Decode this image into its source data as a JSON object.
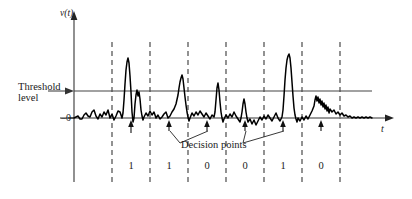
{
  "figure": {
    "type": "signal-waveform-diagram",
    "axis": {
      "y_label": "v(t)",
      "x_label": "t",
      "zero_label": "–0"
    },
    "annotations": {
      "threshold_label_line1": "Threshold",
      "threshold_label_line2": "level",
      "decision_points_label": "Decision points"
    },
    "bits": [
      {
        "value": "1",
        "x": 131
      },
      {
        "value": "1",
        "x": 169
      },
      {
        "value": "0",
        "x": 207
      },
      {
        "value": "0",
        "x": 245
      },
      {
        "value": "1",
        "x": 283
      },
      {
        "value": "0",
        "x": 321
      }
    ],
    "colors": {
      "ink": "#1a1a1a",
      "axis": "#555555",
      "dashed": "#4a4a4a",
      "background": "#ffffff"
    },
    "geometry": {
      "baseline_y": 118,
      "threshold_y": 91,
      "y_axis_x": 74,
      "t_axis_end_x": 394,
      "threshold_end_x": 372,
      "dashed_lines_x": [
        112,
        150,
        188,
        226,
        264,
        302,
        340
      ],
      "dashed_top_y": 42,
      "dashed_bottom_y": 182,
      "decision_arrows_x": [
        131,
        169,
        207,
        245,
        283,
        321
      ]
    }
  },
  "chart_data": {
    "type": "line",
    "title": "",
    "xlabel": "t",
    "ylabel": "v(t)",
    "legend": [],
    "grid": false,
    "annotations": [
      "Threshold level",
      "Decision points",
      "–0"
    ],
    "categories": [
      "1",
      "1",
      "0",
      "0",
      "1",
      "0"
    ],
    "x": [
      74,
      78,
      82,
      86,
      90,
      94,
      98,
      102,
      106,
      110,
      114,
      118,
      122,
      126,
      128,
      130,
      132,
      134,
      138,
      142,
      146,
      150,
      154,
      158,
      162,
      166,
      170,
      174,
      178,
      182,
      186,
      190,
      194,
      198,
      202,
      206,
      210,
      214,
      218,
      222,
      226,
      230,
      234,
      238,
      242,
      246,
      250,
      254,
      258,
      262,
      266,
      270,
      274,
      278,
      282,
      286,
      290,
      294,
      298,
      302,
      306,
      310,
      314,
      318,
      322,
      326,
      330,
      334,
      338,
      342,
      346,
      350,
      354,
      358,
      362,
      366,
      370
    ],
    "y": [
      0,
      2,
      -1,
      6,
      1,
      8,
      -1,
      5,
      2,
      9,
      -2,
      4,
      34,
      29,
      22,
      41,
      -4,
      2,
      9,
      3,
      -3,
      5,
      1,
      -2,
      7,
      3,
      12,
      28,
      22,
      9,
      -3,
      4,
      8,
      2,
      -2,
      6,
      -1,
      23,
      4,
      -2,
      9,
      3,
      11,
      -2,
      5,
      14,
      2,
      -6,
      4,
      -4,
      8,
      -2,
      3,
      7,
      -3,
      5,
      2,
      -5,
      6,
      10,
      35,
      38,
      27,
      9,
      -2,
      3,
      7,
      13,
      9,
      17,
      12,
      8,
      14,
      6,
      9,
      3,
      1
    ],
    "ylim": [
      -10,
      45
    ],
    "xlim": [
      74,
      394
    ]
  }
}
